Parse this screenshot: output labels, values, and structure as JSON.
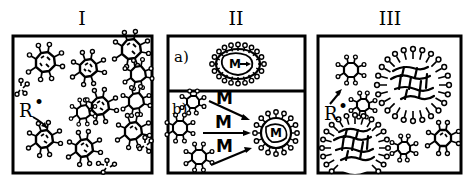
{
  "figure": {
    "background_color": "#ffffff",
    "ink_color": "#000000",
    "width": 475,
    "height": 184
  },
  "panels": [
    {
      "id": "panel-1",
      "numeral": "I",
      "frame": {
        "x": 13,
        "y": 36,
        "w": 139,
        "h": 137
      },
      "labels": [
        {
          "name": "radical-label",
          "text": "R",
          "dot": "•",
          "x": 20,
          "y": 110
        }
      ],
      "description": "Dispersed small surfactant aggregates with radical initiator R-dot",
      "aggregates": [
        {
          "cx": 45,
          "cy": 62,
          "r": 12,
          "type": "spiky-cluster"
        },
        {
          "cx": 88,
          "cy": 68,
          "r": 11,
          "type": "spiky-cluster"
        },
        {
          "cx": 131,
          "cy": 49,
          "r": 12,
          "type": "spiky-cluster"
        },
        {
          "cx": 138,
          "cy": 72,
          "r": 10,
          "type": "spiky-cluster"
        },
        {
          "cx": 100,
          "cy": 106,
          "r": 11,
          "type": "spiky-cluster"
        },
        {
          "cx": 136,
          "cy": 101,
          "r": 11,
          "type": "spiky-cluster"
        },
        {
          "cx": 83,
          "cy": 111,
          "r": 11,
          "type": "spiky-cluster"
        },
        {
          "cx": 133,
          "cy": 131,
          "r": 11,
          "type": "spiky-cluster"
        },
        {
          "cx": 44,
          "cy": 139,
          "r": 12,
          "type": "spiky-cluster"
        },
        {
          "cx": 84,
          "cy": 148,
          "r": 12,
          "type": "spiky-cluster"
        },
        {
          "cx": 21,
          "cy": 88,
          "r": 7,
          "type": "small-cluster"
        },
        {
          "cx": 145,
          "cy": 144,
          "r": 8,
          "type": "small-cluster"
        },
        {
          "cx": 105,
          "cy": 167,
          "r": 8,
          "type": "small-cluster"
        }
      ]
    },
    {
      "id": "panel-2",
      "numeral": "II",
      "frame": {
        "x": 168,
        "y": 36,
        "w": 137,
        "h": 137
      },
      "divider_y": 91,
      "subpanels": [
        {
          "id": "panel-2a",
          "label": "a)",
          "label_x": 176,
          "label_y": 58,
          "inner_label": "M",
          "inner_arrow": "→",
          "description": "Monomer M swelling inside a single micelle"
        },
        {
          "id": "panel-2b",
          "label": "b)",
          "label_x": 174,
          "label_y": 110,
          "arrow_labels": [
            "M",
            "M",
            "M"
          ],
          "inner_label": "M",
          "description": "Three small aggregates plus monomer M combine into one swollen micelle"
        }
      ]
    },
    {
      "id": "panel-3",
      "numeral": "III",
      "frame": {
        "x": 318,
        "y": 36,
        "w": 143,
        "h": 137
      },
      "labels": [
        {
          "name": "radical-label",
          "text": "R",
          "dot": "•",
          "x": 325,
          "y": 113
        }
      ],
      "description": "Mixture of small aggregates and large branched cross-linked polymer particles",
      "aggregates": [
        {
          "cx": 350,
          "cy": 70,
          "r": 12,
          "type": "spiky-cluster"
        },
        {
          "cx": 362,
          "cy": 105,
          "r": 12,
          "type": "spiky-cluster"
        },
        {
          "cx": 404,
          "cy": 148,
          "r": 12,
          "type": "spiky-cluster"
        },
        {
          "cx": 443,
          "cy": 138,
          "r": 13,
          "type": "spiky-cluster"
        },
        {
          "cx": 413,
          "cy": 84,
          "r": 36,
          "type": "branched-particle"
        },
        {
          "cx": 355,
          "cy": 148,
          "r": 34,
          "type": "branched-particle"
        }
      ]
    }
  ],
  "legend_terms": {
    "radical": "R•",
    "monomer": "M"
  }
}
